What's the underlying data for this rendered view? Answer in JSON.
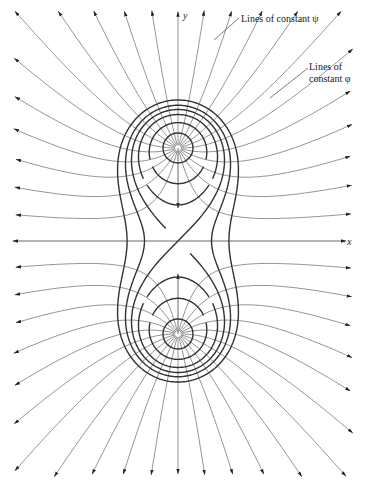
{
  "figure": {
    "axes": {
      "x_label": "x",
      "y_label": "y"
    },
    "annotations": {
      "psi_label": "Lines of constant ψ",
      "phi_label_line1": "Lines of",
      "phi_label_line2": "constant φ"
    },
    "geometry": {
      "center": [
        178,
        241
      ],
      "source_offset": 93,
      "streamline_count": 24,
      "equipotential_levels": [
        0.62,
        0.85,
        1.0,
        1.13,
        1.3
      ],
      "colors": {
        "streamline": "#777777",
        "equipotential": "#333333",
        "axis": "#444444"
      }
    }
  }
}
